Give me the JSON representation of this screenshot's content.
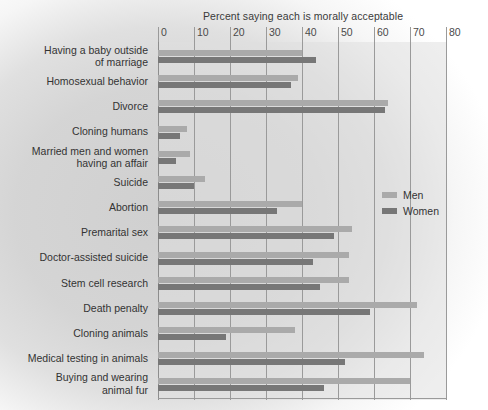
{
  "chart_data": {
    "type": "bar",
    "orientation": "horizontal",
    "title": "Percent saying each is morally acceptable",
    "xlabel": "",
    "ylabel": "",
    "xlim": [
      0,
      80
    ],
    "xticks": [
      0,
      10,
      20,
      30,
      40,
      50,
      60,
      70,
      80
    ],
    "grid": true,
    "legend_position": "middle-right",
    "categories": [
      "Having a baby outside\nof marriage",
      "Homosexual behavior",
      "Divorce",
      "Cloning humans",
      "Married men and women\nhaving an affair",
      "Suicide",
      "Abortion",
      "Premarital sex",
      "Doctor-assisted suicide",
      "Stem cell research",
      "Death penalty",
      "Cloning animals",
      "Medical testing in animals",
      "Buying and wearing\nanimal fur"
    ],
    "series": [
      {
        "name": "Men",
        "color": "#aaaaaa",
        "values": [
          40,
          39,
          64,
          8,
          9,
          13,
          40,
          54,
          53,
          53,
          72,
          38,
          74,
          70
        ]
      },
      {
        "name": "Women",
        "color": "#777777",
        "values": [
          44,
          37,
          63,
          6,
          5,
          10,
          33,
          49,
          43,
          45,
          59,
          19,
          52,
          46
        ]
      }
    ]
  },
  "legend": {
    "items": [
      {
        "label": "Men",
        "swatch": "men"
      },
      {
        "label": "Women",
        "swatch": "women"
      }
    ]
  }
}
